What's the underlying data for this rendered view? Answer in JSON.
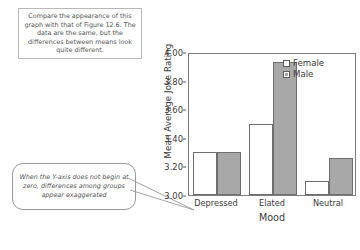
{
  "annotations": {
    "note": {
      "text": "Compare the appearance of this graph with that of Figure 12.6. The data are the same, but the differences between means look quite different."
    },
    "callout": {
      "text": "When the Y-axis does not begin at zero, differences among groups appear exaggerated"
    }
  },
  "legend": {
    "position": "top-right",
    "items": [
      {
        "label": "Female",
        "color": "#ffffff",
        "swatch": "open-square"
      },
      {
        "label": "Male",
        "color": "#a8a8a8",
        "swatch": "filled-square"
      }
    ]
  },
  "chart_data": {
    "type": "bar",
    "title": "",
    "xlabel": "Mood",
    "ylabel": "Mean Average Joke Rating",
    "categories": [
      "Depressed",
      "Elated",
      "Neutral"
    ],
    "series": [
      {
        "name": "Female",
        "values": [
          3.3,
          3.5,
          3.1
        ],
        "color": "#ffffff"
      },
      {
        "name": "Male",
        "values": [
          3.3,
          3.93,
          3.26
        ],
        "color": "#a8a8a8"
      }
    ],
    "ylim": [
      3.0,
      4.0
    ],
    "ytick_values": [
      3.0,
      3.2,
      3.4,
      3.6,
      3.8,
      4.0
    ],
    "ytick_labels": [
      "3.00",
      "3.20",
      "3.40",
      "3.60",
      "3.80",
      "4.00"
    ],
    "grid": false,
    "legend_position": "top-right"
  }
}
